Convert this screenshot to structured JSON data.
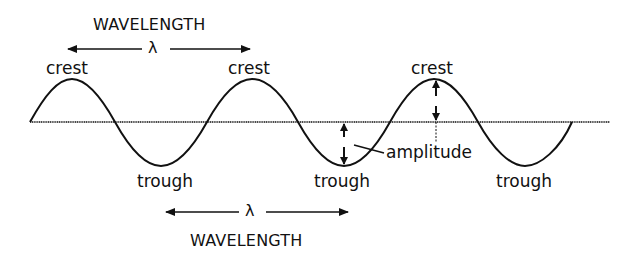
{
  "diagram": {
    "labels": {
      "wavelength_top": "WAVELENGTH",
      "wavelength_bottom": "WAVELENGTH",
      "lambda_top": "λ",
      "lambda_bottom": "λ",
      "crest_1": "crest",
      "crest_2": "crest",
      "crest_3": "crest",
      "trough_1": "trough",
      "trough_2": "trough",
      "trough_3": "trough",
      "amplitude": "amplitude"
    },
    "colors": {
      "stroke": "#111111",
      "background": "#ffffff"
    }
  }
}
